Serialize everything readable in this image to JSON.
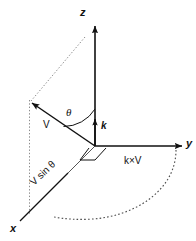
{
  "figure": {
    "type": "vector-diagram",
    "background_color": "#ffffff",
    "stroke_color": "#111111"
  },
  "axes": {
    "x": {
      "label": "x",
      "label_x": 14,
      "label_y": 228
    },
    "y": {
      "label": "y",
      "label_x": 186,
      "label_y": 147
    },
    "z": {
      "label": "z",
      "label_x": 80,
      "label_y": 16
    }
  },
  "vectors": {
    "v": {
      "label": "V",
      "label_x": 43,
      "label_y": 128
    },
    "k": {
      "label": "k",
      "label_x": 101,
      "label_y": 128
    },
    "k_cross_v": {
      "label": "k×V",
      "label_x": 126,
      "label_y": 163
    },
    "v_sin_theta": {
      "label": "V sin θ",
      "label_x": 34,
      "label_y": 186,
      "rotation": -42
    }
  },
  "angle": {
    "label": "θ",
    "label_x": 67,
    "label_y": 115
  },
  "origin": {
    "x": 95,
    "y": 146
  }
}
